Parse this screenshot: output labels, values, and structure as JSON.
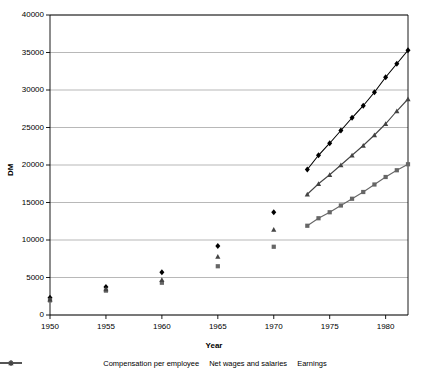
{
  "chart_data": {
    "type": "line",
    "title": "",
    "xlabel": "Year",
    "ylabel": "DM",
    "xlim": [
      1950,
      1982
    ],
    "ylim": [
      0,
      40000
    ],
    "grid": true,
    "legend_position": "bottom",
    "x_ticks": [
      "1950",
      "1955",
      "1960",
      "1965",
      "1970",
      "1975",
      "1980"
    ],
    "x_tick_values": [
      1950,
      1955,
      1960,
      1965,
      1970,
      1975,
      1980
    ],
    "y_ticks": [
      "0",
      "5000",
      "10000",
      "15000",
      "20000",
      "25000",
      "30000",
      "35000",
      "40000"
    ],
    "y_tick_values": [
      0,
      5000,
      10000,
      15000,
      20000,
      25000,
      30000,
      35000,
      40000
    ],
    "series": [
      {
        "name": "Compensation per employee",
        "marker": "diamond",
        "color": "#000000",
        "points": [
          {
            "x": 1950,
            "y": 2300,
            "connected": false
          },
          {
            "x": 1955,
            "y": 3750,
            "connected": false
          },
          {
            "x": 1960,
            "y": 5700,
            "connected": false
          },
          {
            "x": 1965,
            "y": 9200,
            "connected": false
          },
          {
            "x": 1970,
            "y": 13700,
            "connected": false
          },
          {
            "x": 1973,
            "y": 19400,
            "connected": true
          },
          {
            "x": 1974,
            "y": 21300,
            "connected": true
          },
          {
            "x": 1975,
            "y": 22900,
            "connected": true
          },
          {
            "x": 1976,
            "y": 24600,
            "connected": true
          },
          {
            "x": 1977,
            "y": 26300,
            "connected": true
          },
          {
            "x": 1978,
            "y": 27900,
            "connected": true
          },
          {
            "x": 1979,
            "y": 29700,
            "connected": true
          },
          {
            "x": 1980,
            "y": 31700,
            "connected": true
          },
          {
            "x": 1981,
            "y": 33500,
            "connected": true
          },
          {
            "x": 1982,
            "y": 35300,
            "connected": true
          }
        ]
      },
      {
        "name": "Net wages and salaries",
        "marker": "square",
        "color": "#666666",
        "points": [
          {
            "x": 1950,
            "y": 1950,
            "connected": false
          },
          {
            "x": 1955,
            "y": 3250,
            "connected": false
          },
          {
            "x": 1960,
            "y": 4300,
            "connected": false
          },
          {
            "x": 1965,
            "y": 6500,
            "connected": false
          },
          {
            "x": 1970,
            "y": 9100,
            "connected": false
          },
          {
            "x": 1973,
            "y": 11900,
            "connected": true
          },
          {
            "x": 1974,
            "y": 12900,
            "connected": true
          },
          {
            "x": 1975,
            "y": 13700,
            "connected": true
          },
          {
            "x": 1976,
            "y": 14600,
            "connected": true
          },
          {
            "x": 1977,
            "y": 15500,
            "connected": true
          },
          {
            "x": 1978,
            "y": 16400,
            "connected": true
          },
          {
            "x": 1979,
            "y": 17400,
            "connected": true
          },
          {
            "x": 1980,
            "y": 18400,
            "connected": true
          },
          {
            "x": 1981,
            "y": 19300,
            "connected": true
          },
          {
            "x": 1982,
            "y": 20100,
            "connected": true
          }
        ]
      },
      {
        "name": "Earnings",
        "marker": "triangle",
        "color": "#444444",
        "points": [
          {
            "x": 1950,
            "y": 2100,
            "connected": false
          },
          {
            "x": 1955,
            "y": 3450,
            "connected": false
          },
          {
            "x": 1960,
            "y": 4700,
            "connected": false
          },
          {
            "x": 1965,
            "y": 7800,
            "connected": false
          },
          {
            "x": 1970,
            "y": 11400,
            "connected": false
          },
          {
            "x": 1973,
            "y": 16100,
            "connected": true
          },
          {
            "x": 1974,
            "y": 17500,
            "connected": true
          },
          {
            "x": 1975,
            "y": 18700,
            "connected": true
          },
          {
            "x": 1976,
            "y": 20000,
            "connected": true
          },
          {
            "x": 1977,
            "y": 21300,
            "connected": true
          },
          {
            "x": 1978,
            "y": 22600,
            "connected": true
          },
          {
            "x": 1979,
            "y": 24000,
            "connected": true
          },
          {
            "x": 1980,
            "y": 25500,
            "connected": true
          },
          {
            "x": 1981,
            "y": 27200,
            "connected": true
          },
          {
            "x": 1982,
            "y": 28800,
            "connected": true
          }
        ]
      }
    ]
  },
  "legend": {
    "items": [
      {
        "label": "Compensation per employee",
        "marker": "diamond"
      },
      {
        "label": "Net wages and salaries",
        "marker": "square"
      },
      {
        "label": "Earnings",
        "marker": "triangle"
      }
    ]
  },
  "colors": {
    "axis": "#000000",
    "grid": "#999999",
    "series1": "#000000",
    "series2": "#666666",
    "series3": "#444444",
    "background": "#ffffff"
  }
}
